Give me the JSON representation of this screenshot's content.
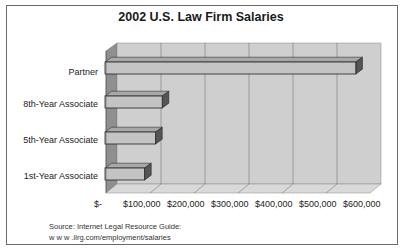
{
  "title": "2002 U.S. Law Firm Salaries",
  "source": {
    "line1": "Source: Internet Legal Resource Guide:",
    "line2": "w w w .ilrg.com/employment/salaries"
  },
  "colors": {
    "back_wall": "#cfcfcf",
    "side_wall": "#8f8f8f",
    "floor": "#d9d9d9",
    "bar_face": "#c4c4c4",
    "bar_top": "#a8a8a8",
    "bar_side": "#555555",
    "gridline": "#7a7a7a"
  },
  "axis": {
    "ticks": [
      "$-",
      "$100,000",
      "$200,000",
      "$300,000",
      "$400,000",
      "$500,000",
      "$600,000"
    ]
  },
  "categories_display": [
    "Partner",
    "8th-Year Associate",
    "5th-Year Associate",
    "1st-Year Associate"
  ],
  "chart_data": {
    "type": "bar",
    "orientation": "horizontal",
    "style": "3d",
    "title": "2002 U.S. Law Firm Salaries",
    "categories": [
      "1st-Year Associate",
      "5th-Year Associate",
      "8th-Year Associate",
      "Partner"
    ],
    "values": [
      90000,
      115000,
      130000,
      570000
    ],
    "xlabel": "",
    "ylabel": "",
    "xlim": [
      0,
      600000
    ],
    "xticks": [
      "$-",
      "$100,000",
      "$200,000",
      "$300,000",
      "$400,000",
      "$500,000",
      "$600,000"
    ],
    "grid": true,
    "legend": null,
    "annotations": [
      "Source: Internet Legal Resource Guide: w w w .ilrg.com/employment/salaries"
    ]
  }
}
